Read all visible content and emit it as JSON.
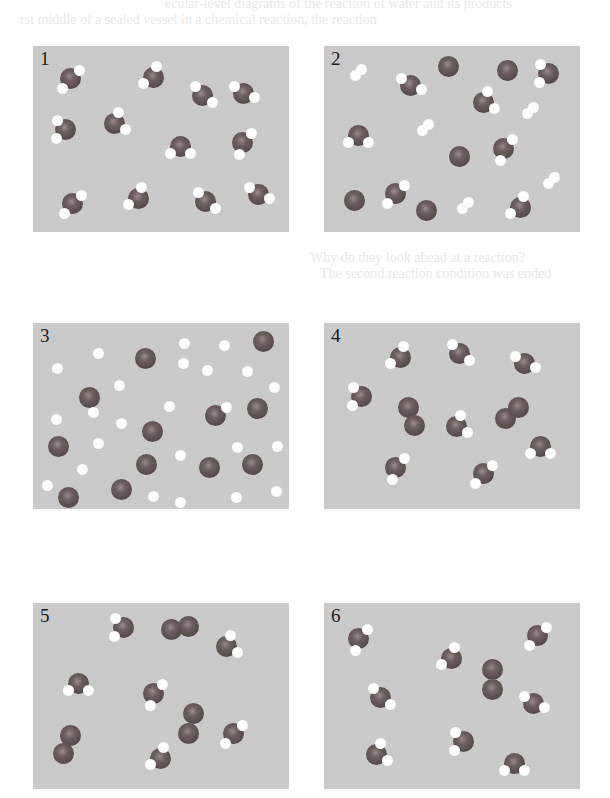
{
  "figure": {
    "colors": {
      "panel_bg": "#c9c9c9",
      "oxygen": "#5a4c4c",
      "hydrogen": "#ffffff",
      "label": "#1a1a1a"
    },
    "ghost_text": [
      {
        "text": "ecular-level diagrams of the reaction of water and its products",
        "x": 165,
        "y": -4
      },
      {
        "text": "rst middle of a sealed vessel in a chemical reaction, the reaction",
        "x": 20,
        "y": 12
      },
      {
        "text": "Why do they look ahead at a reaction?",
        "x": 310,
        "y": 250
      },
      {
        "text": "The second reaction condition was ended",
        "x": 320,
        "y": 266
      }
    ],
    "panels": [
      {
        "label": "1",
        "x": 33,
        "y": 46,
        "contents": "12 water molecules (H2O)",
        "waters": [
          [
            37,
            32
          ],
          [
            120,
            31
          ],
          [
            169,
            49
          ],
          [
            210,
            47
          ],
          [
            32,
            83
          ],
          [
            81,
            77
          ],
          [
            147,
            100
          ],
          [
            209,
            96
          ],
          [
            39,
            157
          ],
          [
            105,
            152
          ],
          [
            172,
            155
          ],
          [
            225,
            148
          ]
        ],
        "o2": [],
        "h2": [],
        "o_atoms": [],
        "h_atoms": []
      },
      {
        "label": "2",
        "x": 324,
        "y": 46,
        "contents": "water molecules, free O atoms and H2 molecules",
        "waters": [
          [
            86,
            39
          ],
          [
            224,
            27
          ],
          [
            159,
            56
          ],
          [
            34,
            89
          ],
          [
            179,
            102
          ],
          [
            71,
            147
          ],
          [
            196,
            161
          ]
        ],
        "o2": [],
        "h2": [
          [
            34,
            26
          ],
          [
            206,
            64
          ],
          [
            101,
            81
          ],
          [
            227,
            134
          ],
          [
            141,
            159
          ]
        ],
        "o_atoms": [
          [
            124,
            20
          ],
          [
            183,
            24
          ],
          [
            135,
            110
          ],
          [
            30,
            154
          ],
          [
            102,
            164
          ]
        ],
        "h_atoms": []
      },
      {
        "label": "3",
        "x": 33,
        "y": 323,
        "contents": "separate O and H atoms",
        "waters": [],
        "o2": [],
        "h2": [],
        "o_atoms": [
          [
            112,
            35
          ],
          [
            230,
            18
          ],
          [
            56,
            74
          ],
          [
            182,
            92
          ],
          [
            224,
            85
          ],
          [
            119,
            108
          ],
          [
            25,
            123
          ],
          [
            113,
            141
          ],
          [
            176,
            144
          ],
          [
            219,
            141
          ],
          [
            35,
            174
          ],
          [
            88,
            166
          ]
        ],
        "h_atoms": [
          [
            65,
            30
          ],
          [
            151,
            20
          ],
          [
            191,
            22
          ],
          [
            24,
            45
          ],
          [
            150,
            40
          ],
          [
            174,
            47
          ],
          [
            214,
            48
          ],
          [
            86,
            62
          ],
          [
            241,
            64
          ],
          [
            60,
            89
          ],
          [
            136,
            83
          ],
          [
            193,
            84
          ],
          [
            23,
            96
          ],
          [
            88,
            100
          ],
          [
            65,
            120
          ],
          [
            204,
            124
          ],
          [
            244,
            123
          ],
          [
            147,
            132
          ],
          [
            49,
            146
          ],
          [
            14,
            162
          ],
          [
            120,
            173
          ],
          [
            147,
            179
          ],
          [
            203,
            174
          ],
          [
            243,
            168
          ]
        ]
      },
      {
        "label": "4",
        "x": 324,
        "y": 323,
        "contents": "8 water molecules and 2 O2 molecules",
        "waters": [
          [
            76,
            34
          ],
          [
            135,
            30
          ],
          [
            200,
            40
          ],
          [
            37,
            73
          ],
          [
            132,
            103
          ],
          [
            216,
            123
          ],
          [
            71,
            144
          ],
          [
            159,
            150
          ]
        ],
        "o2": [
          [
            [
              84,
              84
            ],
            [
              90,
              102
            ]
          ],
          [
            [
              181,
              95
            ],
            [
              194,
              84
            ]
          ]
        ],
        "h2": [],
        "o_atoms": [],
        "h_atoms": []
      },
      {
        "label": "5",
        "x": 33,
        "y": 603,
        "contents": "6 water molecules and 3 O2 molecules",
        "waters": [
          [
            90,
            24
          ],
          [
            193,
            43
          ],
          [
            45,
            80
          ],
          [
            120,
            90
          ],
          [
            200,
            130
          ],
          [
            127,
            155
          ]
        ],
        "o2": [
          [
            [
              138,
              26
            ],
            [
              155,
              23
            ]
          ],
          [
            [
              160,
              110
            ],
            [
              155,
              130
            ]
          ],
          [
            [
              37,
              132
            ],
            [
              30,
              150
            ]
          ]
        ],
        "h2": [],
        "o_atoms": [],
        "h_atoms": []
      },
      {
        "label": "6",
        "x": 324,
        "y": 603,
        "contents": "8 water molecules and 1 O2 molecule",
        "waters": [
          [
            34,
            35
          ],
          [
            213,
            32
          ],
          [
            127,
            55
          ],
          [
            56,
            94
          ],
          [
            209,
            100
          ],
          [
            139,
            138
          ],
          [
            52,
            151
          ],
          [
            190,
            160
          ]
        ],
        "o2": [
          [
            [
              168,
              66
            ],
            [
              168,
              86
            ]
          ]
        ],
        "h2": [],
        "o_atoms": [],
        "h_atoms": []
      }
    ]
  }
}
